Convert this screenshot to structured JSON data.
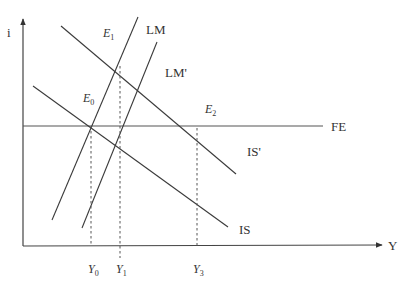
{
  "diagram": {
    "type": "IS-LM-FE",
    "axes": {
      "y_label": "i",
      "x_label": "Y"
    },
    "curves": {
      "is": {
        "label": "IS"
      },
      "is_prime": {
        "label": "IS'"
      },
      "lm": {
        "label": "LM"
      },
      "lm_prime": {
        "label": "LM'"
      },
      "fe": {
        "label": "FE"
      }
    },
    "points": {
      "e0": {
        "letter": "E",
        "sub": "0"
      },
      "e1": {
        "letter": "E",
        "sub": "1"
      },
      "e2": {
        "letter": "E",
        "sub": "2"
      }
    },
    "x_ticks": [
      {
        "letter": "Y",
        "sub": "0"
      },
      {
        "letter": "Y",
        "sub": "1"
      },
      {
        "letter": "Y",
        "sub": "3"
      }
    ],
    "colors": {
      "line": "#3a3a3a",
      "background": "#ffffff"
    }
  }
}
